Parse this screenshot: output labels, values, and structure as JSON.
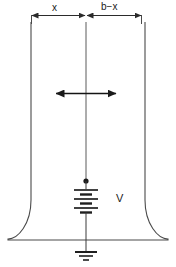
{
  "figure": {
    "type": "circuit-diagram",
    "stroke_color": "#3a3a3a",
    "background_color": "#ffffff"
  },
  "dimensions": {
    "left_segment_label": "x",
    "right_segment_label": "b−x"
  },
  "annotations": {
    "arrow_label": "",
    "source_label": "V"
  },
  "elements": {
    "battery_name": "battery-symbol",
    "ground_name": "ground-symbol",
    "node_name": "junction-dot",
    "outline_name": "electrode-outline",
    "center_line_name": "axis-line",
    "double_arrow_name": "displacement-arrow"
  },
  "geometry": {
    "width": 176,
    "height": 267,
    "left_wall_x": 31,
    "right_wall_x": 141,
    "center_x": 86,
    "dim_line_y": 15,
    "base_y": 240,
    "flare_left_x": 8,
    "flare_right_x": 166
  }
}
